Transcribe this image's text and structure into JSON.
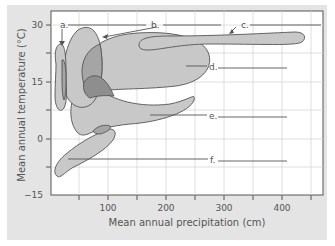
{
  "figure": {
    "x_axis": {
      "title": "Mean annual precipitation (cm)",
      "ticks": [
        "100",
        "200",
        "300",
        "400"
      ]
    },
    "y_axis": {
      "title": "Mean annual temperature (°C)",
      "ticks": [
        "30",
        "15",
        "0",
        "−15"
      ]
    },
    "callouts": [
      {
        "id": "a",
        "label": "a."
      },
      {
        "id": "b",
        "label": "b."
      },
      {
        "id": "c",
        "label": "c."
      },
      {
        "id": "d",
        "label": "d."
      },
      {
        "id": "e",
        "label": "e."
      },
      {
        "id": "f",
        "label": "f."
      }
    ]
  },
  "colors": {
    "panel": "#e4e4e4",
    "plot_bg": "#ffffff",
    "grid": "#d2d2d2",
    "region_fill": "#c8c8c8",
    "overlap_fill": "#a5a5a5",
    "overlap_dark": "#8a8a8a",
    "outline": "#555555",
    "text": "#555555"
  }
}
